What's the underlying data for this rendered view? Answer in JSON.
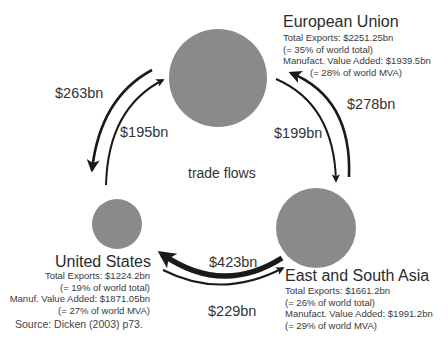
{
  "diagram": {
    "center_label": "trade flows",
    "source": "Source: Dicken (2003) p73.",
    "colors": {
      "circle_fill": "#8a8a8a",
      "arrow": "#1a1a1a",
      "text": "#333333"
    },
    "regions": {
      "eu": {
        "name": "European Union",
        "lines": [
          "Total Exports: $2251.25bn",
          "(= 35% of world total)",
          "Manufact. Value Added: $1939.5bn",
          "(= 28% of world MVA)"
        ],
        "circle": {
          "cx": 218,
          "cy": 78,
          "r": 49
        }
      },
      "us": {
        "name": "United States",
        "lines": [
          "Total Exports: $1224.2bn",
          "(= 19% of world total)",
          "Manuf. Value Added: $1871.05bn",
          "(= 27% of world MVA)"
        ],
        "circle": {
          "cx": 117,
          "cy": 224,
          "r": 25
        }
      },
      "asia": {
        "name": "East and South Asia",
        "lines": [
          "Total Exports: $1661.2bn",
          "(= 26% of world total)",
          "Manufact. Value Added: $1991.2bn",
          "(= 29% of world MVA)"
        ],
        "circle": {
          "cx": 316,
          "cy": 228,
          "r": 40
        }
      }
    },
    "flows": [
      {
        "from": "European Union",
        "to": "United States",
        "label": "$263bn"
      },
      {
        "from": "United States",
        "to": "European Union",
        "label": "$195bn"
      },
      {
        "from": "European Union",
        "to": "East and South Asia",
        "label": "$199bn"
      },
      {
        "from": "East and South Asia",
        "to": "European Union",
        "label": "$278bn"
      },
      {
        "from": "East and South Asia",
        "to": "United States",
        "label": "$423bn"
      },
      {
        "from": "United States",
        "to": "East and South Asia",
        "label": "$229bn"
      }
    ]
  }
}
